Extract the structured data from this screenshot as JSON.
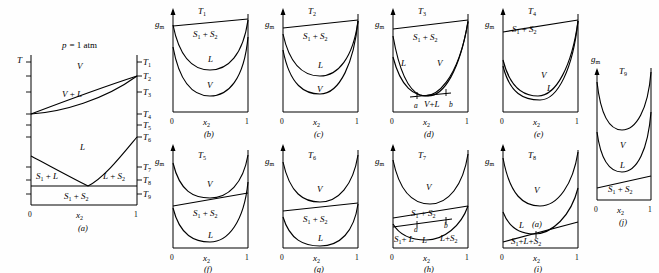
{
  "figure": {
    "caption_letters": [
      "(a)",
      "(b)",
      "(c)",
      "(d)",
      "(e)",
      "(f)",
      "(g)",
      "(h)",
      "(i)",
      "(j)"
    ],
    "axis_labels": {
      "temperature": "T",
      "gibbs_molar": "g",
      "gibbs_sub": "m",
      "composition": "x",
      "composition_sub": "2",
      "x_min": "0",
      "x_max": "1"
    },
    "pressure_note": {
      "symbol": "p",
      "text": "= 1 atm"
    }
  },
  "phase_diagram": {
    "name": "panel-a",
    "letter": "(a)",
    "pressure": "p = 1 atm",
    "y_axis_label": "T",
    "x_axis_label": "x",
    "x_axis_sub": "2",
    "x_ticks": [
      "0",
      "1"
    ],
    "temperature_ticks": [
      "T1",
      "T2",
      "T3",
      "T4",
      "T5",
      "T6",
      "T7",
      "T8",
      "T9"
    ],
    "temperature_tick_labels": [
      "T",
      "T",
      "T",
      "T",
      "T",
      "T",
      "T",
      "T",
      "T"
    ],
    "temperature_tick_subs": [
      "1",
      "2",
      "3",
      "4",
      "5",
      "6",
      "7",
      "8",
      "9"
    ],
    "regions": [
      {
        "label": "V",
        "name": "vapor-region"
      },
      {
        "label": "V + L",
        "name": "vapor-liquid-region"
      },
      {
        "label": "L",
        "name": "liquid-region"
      },
      {
        "label": "S",
        "sub": "1",
        "tail": " + L",
        "name": "solid1-liquid-region"
      },
      {
        "label": "L + S",
        "sub": "2",
        "tail": "",
        "name": "liquid-solid2-region"
      },
      {
        "label": "S",
        "sub": "1",
        "tail": " + S",
        "sub2": "2",
        "name": "solid1-solid2-region"
      }
    ]
  },
  "gibbs_panels": [
    {
      "letter": "(b)",
      "name": "panel-b",
      "temperature": "T",
      "temperature_sub": "1",
      "y_label": "g",
      "y_label_sub": "m",
      "x_label": "x",
      "x_label_sub": "2",
      "x_ticks": [
        "0",
        "1"
      ],
      "curves": [
        {
          "name": "solid-line",
          "label": "S1 + S2",
          "text": "S",
          "sub": "1",
          "tail": " + S",
          "sub2": "2",
          "type": "line"
        },
        {
          "name": "liquid-curve",
          "label": "L",
          "type": "curve"
        },
        {
          "name": "vapor-curve",
          "label": "V",
          "type": "curve"
        }
      ],
      "order_top_to_bottom": [
        "S1 + S2",
        "L",
        "V"
      ]
    },
    {
      "letter": "(c)",
      "name": "panel-c",
      "temperature": "T",
      "temperature_sub": "2",
      "y_label": "g",
      "y_label_sub": "m",
      "x_label": "x",
      "x_label_sub": "2",
      "x_ticks": [
        "0",
        "1"
      ],
      "curves": [
        {
          "name": "solid-line",
          "label": "S1 + S2",
          "text": "S",
          "sub": "1",
          "tail": " + S",
          "sub2": "2",
          "type": "line"
        },
        {
          "name": "liquid-curve",
          "label": "L",
          "type": "curve"
        },
        {
          "name": "vapor-curve",
          "label": "V",
          "type": "curve"
        }
      ],
      "order_top_to_bottom": [
        "S1 + S2",
        "L",
        "V"
      ],
      "note": "L and V curves meet at x2 = 1"
    },
    {
      "letter": "(d)",
      "name": "panel-d",
      "temperature": "T",
      "temperature_sub": "3",
      "y_label": "g",
      "y_label_sub": "m",
      "x_label": "x",
      "x_label_sub": "2",
      "x_ticks": [
        "0",
        "1"
      ],
      "curves": [
        {
          "name": "solid-line",
          "label": "S1 + S2",
          "text": "S",
          "sub": "1",
          "tail": " + S",
          "sub2": "2",
          "type": "line"
        },
        {
          "name": "liquid-curve",
          "label": "L",
          "type": "curve"
        },
        {
          "name": "vapor-curve",
          "label": "V",
          "type": "curve"
        }
      ],
      "tangent_label": "V + L",
      "tangent_points": [
        "a",
        "b"
      ],
      "note": "L and V curves cross; common tangent from a to b"
    },
    {
      "letter": "(e)",
      "name": "panel-e",
      "temperature": "T",
      "temperature_sub": "4",
      "y_label": "g",
      "y_label_sub": "m",
      "x_label": "x",
      "x_label_sub": "2",
      "x_ticks": [
        "0",
        "1"
      ],
      "curves": [
        {
          "name": "solid-line",
          "label": "S1 + S2",
          "text": "S",
          "sub": "1",
          "tail": " + S",
          "sub2": "2",
          "type": "line"
        },
        {
          "name": "vapor-curve",
          "label": "V",
          "type": "curve"
        },
        {
          "name": "liquid-curve",
          "label": "L",
          "type": "curve"
        }
      ],
      "order_top_to_bottom": [
        "S1 + S2",
        "V",
        "L"
      ]
    },
    {
      "letter": "(f)",
      "name": "panel-f",
      "temperature": "T",
      "temperature_sub": "5",
      "y_label": "g",
      "y_label_sub": "m",
      "x_label": "x",
      "x_label_sub": "2",
      "x_ticks": [
        "0",
        "1"
      ],
      "curves": [
        {
          "name": "vapor-curve",
          "label": "V",
          "type": "curve"
        },
        {
          "name": "solid-line",
          "label": "S1 + S2",
          "text": "S",
          "sub": "1",
          "tail": " + S",
          "sub2": "2",
          "type": "line"
        },
        {
          "name": "liquid-curve",
          "label": "L",
          "type": "curve"
        }
      ],
      "order_top_to_bottom": [
        "V",
        "S1 + S2",
        "L"
      ]
    },
    {
      "letter": "(g)",
      "name": "panel-g",
      "temperature": "T",
      "temperature_sub": "6",
      "y_label": "g",
      "y_label_sub": "m",
      "x_label": "x",
      "x_label_sub": "2",
      "x_ticks": [
        "0",
        "1"
      ],
      "curves": [
        {
          "name": "vapor-curve",
          "label": "V",
          "type": "curve"
        },
        {
          "name": "solid-line",
          "label": "S1 + S2",
          "text": "S",
          "sub": "1",
          "tail": " + S",
          "sub2": "2",
          "type": "line"
        },
        {
          "name": "liquid-curve",
          "label": "L",
          "type": "curve"
        }
      ],
      "order_top_to_bottom": [
        "V",
        "S1 + S2",
        "L"
      ],
      "note": "solid line touches L curve at x2 = 1"
    },
    {
      "letter": "(h)",
      "name": "panel-h",
      "temperature": "T",
      "temperature_sub": "7",
      "y_label": "g",
      "y_label_sub": "m",
      "x_label": "x",
      "x_label_sub": "2",
      "x_ticks": [
        "0",
        "1"
      ],
      "curves": [
        {
          "name": "vapor-curve",
          "label": "V",
          "type": "curve"
        },
        {
          "name": "solid-line",
          "label": "S1 + S2",
          "text": "S",
          "sub": "1",
          "tail": " + S",
          "sub2": "2",
          "type": "line"
        },
        {
          "name": "liquid-curve",
          "label": "L",
          "type": "curve"
        }
      ],
      "tangent_points": [
        "a",
        "b"
      ],
      "tangent_labels": [
        {
          "text": "S",
          "sub": "1",
          "tail": " + L",
          "name": "solid1-liquid-label"
        },
        {
          "text": "L + S",
          "sub": "2",
          "tail": "",
          "name": "liquid-solid2-label"
        }
      ]
    },
    {
      "letter": "(i)",
      "name": "panel-i",
      "temperature": "T",
      "temperature_sub": "8",
      "y_label": "g",
      "y_label_sub": "m",
      "x_label": "x",
      "x_label_sub": "2",
      "x_ticks": [
        "0",
        "1"
      ],
      "curves": [
        {
          "name": "vapor-curve",
          "label": "V",
          "type": "curve"
        },
        {
          "name": "liquid-curve",
          "label": "L",
          "type": "curve"
        },
        {
          "name": "solid-line",
          "label": "S1 + L + S2",
          "text": "S",
          "sub": "1",
          "tail": "+ L + S",
          "sub2": "2",
          "type": "line"
        }
      ],
      "tangent_point_label": "(a)",
      "note": "eutectic: common tangent touches L at single point"
    },
    {
      "letter": "(j)",
      "name": "panel-j",
      "temperature": "T",
      "temperature_sub": "9",
      "y_label": "g",
      "y_label_sub": "m",
      "x_label": "x",
      "x_label_sub": "2",
      "x_ticks": [
        "0",
        "1"
      ],
      "curves": [
        {
          "name": "vapor-curve",
          "label": "V",
          "type": "curve"
        },
        {
          "name": "liquid-curve",
          "label": "L",
          "type": "curve"
        },
        {
          "name": "solid-line",
          "label": "S1 + S2",
          "text": "S",
          "sub": "1",
          "tail": " + S",
          "sub2": "2",
          "type": "line"
        }
      ],
      "order_top_to_bottom": [
        "V",
        "L",
        "S1 + S2"
      ]
    }
  ],
  "colors": {
    "ink": "#000000",
    "background": "#fefefe"
  }
}
